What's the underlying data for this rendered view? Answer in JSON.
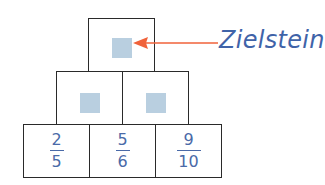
{
  "colors": {
    "border": "#2a2a2a",
    "placeholder": "#b9cfe0",
    "text": "#4a6aa8",
    "arrow": "#f0623a",
    "label": "#3f63a8"
  },
  "annotation": {
    "label": "Zielstein",
    "arrow_icon": "arrow-left-icon"
  },
  "pyramid": {
    "top": [
      {
        "type": "placeholder"
      }
    ],
    "middle": [
      {
        "type": "placeholder"
      },
      {
        "type": "placeholder"
      }
    ],
    "bottom": [
      {
        "numerator": "2",
        "denominator": "5"
      },
      {
        "numerator": "5",
        "denominator": "6"
      },
      {
        "numerator": "9",
        "denominator": "10"
      }
    ]
  }
}
